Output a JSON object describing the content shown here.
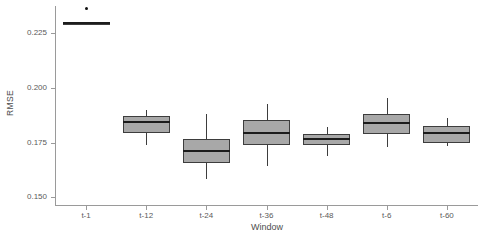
{
  "chart_data": {
    "type": "box",
    "title": "",
    "xlabel": "Window",
    "ylabel": "RMSE",
    "ylim": [
      0.1465,
      0.2375
    ],
    "yticks": [
      0.15,
      0.175,
      0.2,
      0.225
    ],
    "ytick_labels": [
      "0.150",
      "0.175",
      "0.200",
      "0.225"
    ],
    "categories": [
      "t-1",
      "t-12",
      "t-24",
      "t-36",
      "t-48",
      "t-6",
      "t-60"
    ],
    "grid": false,
    "legend": "none",
    "boxes": [
      {
        "category": "t-1",
        "lower_whisker": 0.2285,
        "q1": 0.2287,
        "median": 0.2295,
        "q3": 0.2303,
        "upper_whisker": 0.2305,
        "outliers": [
          0.2365
        ]
      },
      {
        "category": "t-12",
        "lower_whisker": 0.174,
        "q1": 0.1795,
        "median": 0.1845,
        "q3": 0.187,
        "upper_whisker": 0.19,
        "outliers": []
      },
      {
        "category": "t-24",
        "lower_whisker": 0.1585,
        "q1": 0.1655,
        "median": 0.1712,
        "q3": 0.1768,
        "upper_whisker": 0.188,
        "outliers": []
      },
      {
        "category": "t-36",
        "lower_whisker": 0.1645,
        "q1": 0.174,
        "median": 0.1795,
        "q3": 0.1855,
        "upper_whisker": 0.1925,
        "outliers": []
      },
      {
        "category": "t-48",
        "lower_whisker": 0.169,
        "q1": 0.1738,
        "median": 0.1765,
        "q3": 0.179,
        "upper_whisker": 0.1822,
        "outliers": []
      },
      {
        "category": "t-6",
        "lower_whisker": 0.173,
        "q1": 0.179,
        "median": 0.184,
        "q3": 0.188,
        "upper_whisker": 0.1955,
        "outliers": []
      },
      {
        "category": "t-60",
        "lower_whisker": 0.1735,
        "q1": 0.175,
        "median": 0.1793,
        "q3": 0.1825,
        "upper_whisker": 0.1862,
        "outliers": []
      }
    ],
    "colors": {
      "box_fill": "#a8a8a8",
      "box_border": "#3d3d3d",
      "median": "#1c1c1c",
      "outlier": "#111111",
      "axis": "#9a9a9a",
      "text": "#5a5a5a",
      "background": "#ffffff"
    }
  }
}
